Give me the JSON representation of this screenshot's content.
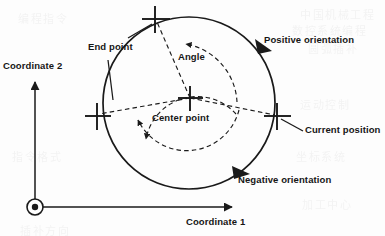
{
  "figure": {
    "type": "technical-diagram",
    "background_color": "#fdfdfd",
    "line_color": "#1a1a1a"
  },
  "axes": {
    "origin_symbol": "out-of-plane-axis-dot",
    "horizontal": {
      "name": "coordinate-1-axis",
      "label": "Coordinate 1",
      "arrow": "right"
    },
    "vertical": {
      "name": "coordinate-2-axis",
      "label": "Coordinate 2",
      "arrow": "up"
    }
  },
  "labels": {
    "end_point": "End point",
    "angle": "Angle",
    "center_point": "Center point",
    "positive_orientation": "Positive orientation",
    "negative_orientation": "Negative orientation",
    "current_position": "Current position",
    "coordinate_1": "Coordinate 1",
    "coordinate_2": "Coordinate 2"
  },
  "markers": [
    {
      "name": "end-point-marker",
      "glyph": "cross",
      "x": 155,
      "y": 19
    },
    {
      "name": "center-point-marker",
      "glyph": "cross",
      "x": 190,
      "y": 98
    },
    {
      "name": "start-point-marker",
      "glyph": "cross",
      "x": 97,
      "y": 116
    },
    {
      "name": "current-position-marker",
      "glyph": "cross",
      "x": 277,
      "y": 116
    }
  ],
  "circle": {
    "name": "interpolation-circle",
    "cx": 189,
    "cy": 103,
    "r": 86,
    "stroke": "#1a1a1a",
    "style": "solid"
  },
  "orientation_arrows": [
    {
      "name": "positive-orientation-arrowhead",
      "direction": "clockwise-top-right",
      "x": 263,
      "y": 47
    },
    {
      "name": "negative-orientation-arrowhead",
      "direction": "counterclockwise-bottom-right",
      "x": 241,
      "y": 172
    }
  ],
  "dashed_arcs": [
    {
      "name": "angle-sweep-arc",
      "style": "dashed",
      "arrowhead_at": "end-point-side"
    },
    {
      "name": "rotation-sweep-arc",
      "style": "dashed",
      "arrowhead_at": "left-side"
    }
  ],
  "dashed_radii": [
    {
      "name": "radius-to-end-point",
      "from": "center-point",
      "to": "end-point"
    },
    {
      "name": "radius-to-current-position",
      "from": "center-point",
      "to": "current-position"
    },
    {
      "name": "radius-to-start-point",
      "from": "center-point",
      "to": "start-point"
    }
  ],
  "leader_lines": [
    {
      "name": "leader-end-point-upper",
      "label": "End point"
    },
    {
      "name": "leader-end-point-lower",
      "label": "End point"
    },
    {
      "name": "leader-current-position",
      "label": "Current position"
    }
  ],
  "bleed_through": [
    {
      "text": "中国机械工程",
      "x": 300,
      "y": 6
    },
    {
      "text": "数控系统编程",
      "x": 292,
      "y": 22
    },
    {
      "text": "圆弧插补",
      "x": 308,
      "y": 40
    },
    {
      "text": "运动控制",
      "x": 300,
      "y": 96
    },
    {
      "text": "坐标系统",
      "x": 296,
      "y": 148
    },
    {
      "text": "加工中心",
      "x": 302,
      "y": 196
    },
    {
      "text": "编程指令",
      "x": 18,
      "y": 10
    },
    {
      "text": "指令格式",
      "x": 12,
      "y": 148
    },
    {
      "text": "插补方向",
      "x": 20,
      "y": 222
    }
  ]
}
